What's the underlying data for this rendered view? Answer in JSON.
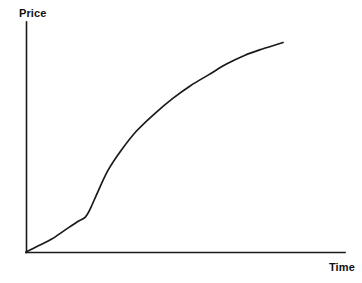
{
  "chart_data": {
    "type": "line",
    "title": "",
    "subtitle": "",
    "xlabel": "Time",
    "ylabel": "Price",
    "legend": [],
    "legend_position": "none",
    "grid": false,
    "axis_style": "two-axis-L-shape-no-ticks",
    "tick_labels": {
      "x": [],
      "y": []
    },
    "xlim": [
      0,
      1
    ],
    "ylim": [
      0,
      1
    ],
    "annotations": [],
    "series": [
      {
        "name": "Price over Time",
        "shape": "sigmoid-s-curve",
        "color": "#1a1a1a",
        "x": [
          0.0,
          0.05,
          0.1,
          0.15,
          0.2,
          0.23,
          0.25,
          0.28,
          0.32,
          0.37,
          0.43,
          0.5,
          0.57,
          0.64,
          0.71,
          0.78,
          0.85,
          0.92,
          1.0
        ],
        "y": [
          0.0,
          0.03,
          0.06,
          0.1,
          0.14,
          0.16,
          0.2,
          0.28,
          0.38,
          0.47,
          0.56,
          0.64,
          0.71,
          0.77,
          0.82,
          0.87,
          0.91,
          0.94,
          0.97
        ]
      }
    ]
  },
  "axes": {
    "y_axis_name": "Price",
    "x_axis_name": "Time"
  },
  "colors": {
    "background": "#ffffff",
    "ink": "#1a1a1a",
    "label": "#111111"
  }
}
